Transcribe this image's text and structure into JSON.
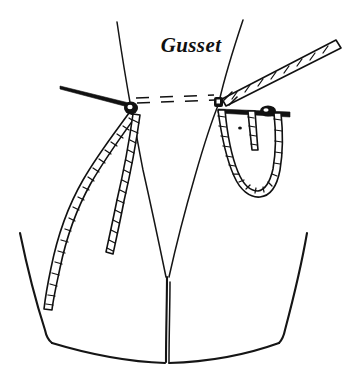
{
  "figure": {
    "title": "Gusset",
    "caption": "Gusset",
    "background_color": "#ffffff",
    "ink_color": "#111111",
    "style": "pen-and-ink line drawing",
    "labels": [
      {
        "id": "gusset-label",
        "text": "Gusset",
        "x": 191,
        "y": 45,
        "font_style": "italic-serif"
      }
    ],
    "knots": [
      {
        "id": "left-knot",
        "x": 131,
        "y": 108
      },
      {
        "id": "right-knot",
        "x": 219,
        "y": 102
      }
    ],
    "pins": [
      {
        "id": "left-pin",
        "orientation": "horizontal-left",
        "from_x": 60,
        "from_y": 86,
        "to_x": 133,
        "to_y": 106,
        "has_head": false
      },
      {
        "id": "right-pin",
        "orientation": "horizontal-right",
        "from_x": 218,
        "from_y": 110,
        "to_x": 290,
        "to_y": 115,
        "has_head": true,
        "head_x": 268,
        "head_y": 111
      }
    ],
    "cords": [
      {
        "id": "left-long-cord",
        "description": "long braided cord curving down-left"
      },
      {
        "id": "left-short-cord",
        "description": "short braided cord hanging straight down"
      },
      {
        "id": "right-loop-cord",
        "description": "braided cord forming a U-shaped loop"
      },
      {
        "id": "right-inner-tail",
        "description": "short braided tail inside the loop"
      },
      {
        "id": "upper-right-cord",
        "description": "thick braided cord running to upper right"
      }
    ],
    "panels": [
      {
        "id": "left-side-panel",
        "description": "left garment side panel edge"
      },
      {
        "id": "right-side-panel",
        "description": "right garment side panel edge"
      },
      {
        "id": "center-seam",
        "description": "center V seam running to hem"
      },
      {
        "id": "hem-line",
        "description": "curved bottom hem"
      }
    ],
    "marks": [
      {
        "id": "dot-mark",
        "x": 240,
        "y": 128
      }
    ]
  }
}
